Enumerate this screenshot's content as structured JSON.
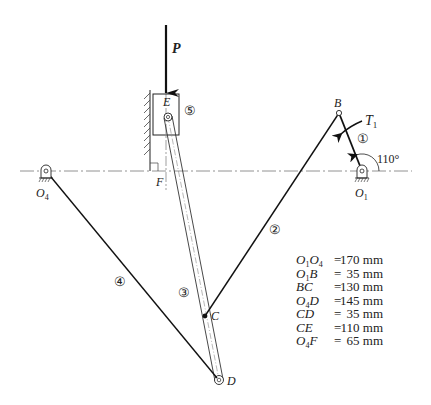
{
  "diagram": {
    "type": "mechanism",
    "force": {
      "label": "P",
      "direction": "down"
    },
    "torque": {
      "label": "T",
      "subscript": "1"
    },
    "angle": {
      "label": "110°"
    },
    "points": {
      "O1": {
        "main": "O",
        "sub": "1"
      },
      "O4": {
        "main": "O",
        "sub": "4"
      },
      "B": "B",
      "C": "C",
      "D": "D",
      "E": "E",
      "F": "F"
    },
    "links": [
      {
        "id": "1",
        "label": "①"
      },
      {
        "id": "2",
        "label": "②"
      },
      {
        "id": "3",
        "label": "③"
      },
      {
        "id": "4",
        "label": "④"
      },
      {
        "id": "5",
        "label": "⑤"
      }
    ],
    "dimensions": [
      {
        "name_main": "O",
        "name_sub1": "1",
        "name_mid": "O",
        "name_sub2": "4",
        "eq": "=",
        "value": "170 mm"
      },
      {
        "name_main": "O",
        "name_sub1": "1",
        "name_mid": "B",
        "name_sub2": "",
        "eq": "=",
        "value": "35 mm"
      },
      {
        "name_main": "BC",
        "name_sub1": "",
        "name_mid": "",
        "name_sub2": "",
        "eq": "=",
        "value": "130 mm"
      },
      {
        "name_main": "O",
        "name_sub1": "4",
        "name_mid": "D",
        "name_sub2": "",
        "eq": "=",
        "value": "145 mm"
      },
      {
        "name_main": "CD",
        "name_sub1": "",
        "name_mid": "",
        "name_sub2": "",
        "eq": "=",
        "value": "35 mm"
      },
      {
        "name_main": "CE",
        "name_sub1": "",
        "name_mid": "",
        "name_sub2": "",
        "eq": "=",
        "value": "110 mm"
      },
      {
        "name_main": "O",
        "name_sub1": "4",
        "name_mid": "F",
        "name_sub2": "",
        "eq": "=",
        "value": "65 mm"
      }
    ]
  }
}
